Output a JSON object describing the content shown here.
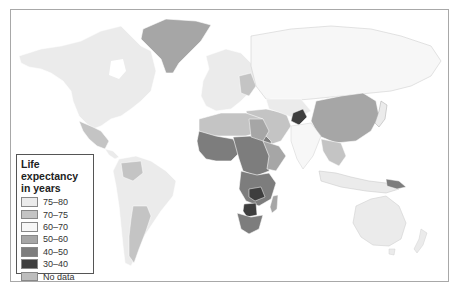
{
  "map": {
    "type": "choropleth world map",
    "subject": "Life expectancy by country"
  },
  "legend": {
    "title": "Life expectancy in years",
    "title_line1": "Life expectancy",
    "title_line2": "in years",
    "items": [
      {
        "label": "75–80",
        "color": "#ebebeb"
      },
      {
        "label": "70–75",
        "color": "#c4c4c4"
      },
      {
        "label": "60–70",
        "color": "#f7f7f7"
      },
      {
        "label": "50–60",
        "color": "#a6a6a6"
      },
      {
        "label": "40–50",
        "color": "#7d7d7d"
      },
      {
        "label": "30–40",
        "color": "#3e3e3e"
      },
      {
        "label": "No data",
        "color": "#bdbdbd"
      }
    ]
  },
  "colors": {
    "ocean": "#ffffff",
    "border": "#a8a8a8",
    "high": "#ebebeb",
    "mid_high": "#c4c4c4",
    "mid": "#f7f7f7",
    "mid_low": "#a6a6a6",
    "low": "#7d7d7d",
    "lowest": "#3e3e3e",
    "nodata": "#a0a0a0"
  }
}
